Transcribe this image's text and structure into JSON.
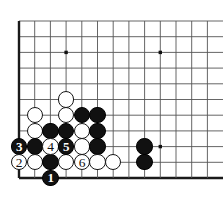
{
  "figure": {
    "kind": "go-board-diagram",
    "board": {
      "line_color": "#555555",
      "edge_color": "#1a1a1a",
      "background": "#ffffff",
      "origin_x": 19,
      "origin_y": 21,
      "spacing": 15.7,
      "cols": 13,
      "rows": 11,
      "edge_left_width": 2.4,
      "edge_bottom_width": 2.4,
      "line_width": 0.9
    },
    "star_points": [
      {
        "col": 3,
        "row": 2,
        "label": "hoshi-upper-left"
      },
      {
        "col": 9,
        "row": 2,
        "label": "hoshi-upper-right"
      },
      {
        "col": 9,
        "row": 8,
        "label": "hoshi-lower-right"
      }
    ],
    "stone_radius": 8.2,
    "stones": [
      {
        "col": 3,
        "row": 5,
        "color": "white",
        "label": ""
      },
      {
        "col": 1,
        "row": 6,
        "color": "white",
        "label": ""
      },
      {
        "col": 3,
        "row": 6,
        "color": "white",
        "label": ""
      },
      {
        "col": 4,
        "row": 6,
        "color": "black",
        "label": ""
      },
      {
        "col": 5,
        "row": 6,
        "color": "black",
        "label": ""
      },
      {
        "col": 1,
        "row": 7,
        "color": "white",
        "label": ""
      },
      {
        "col": 2,
        "row": 7,
        "color": "black",
        "label": ""
      },
      {
        "col": 3,
        "row": 7,
        "color": "black",
        "label": ""
      },
      {
        "col": 4,
        "row": 7,
        "color": "white",
        "label": ""
      },
      {
        "col": 5,
        "row": 7,
        "color": "black",
        "label": ""
      },
      {
        "col": 0,
        "row": 8,
        "color": "black",
        "label": "3"
      },
      {
        "col": 1,
        "row": 8,
        "color": "black",
        "label": ""
      },
      {
        "col": 2,
        "row": 8,
        "color": "white",
        "label": "4"
      },
      {
        "col": 3,
        "row": 8,
        "color": "black",
        "label": "5"
      },
      {
        "col": 4,
        "row": 8,
        "color": "white",
        "label": ""
      },
      {
        "col": 5,
        "row": 8,
        "color": "black",
        "label": ""
      },
      {
        "col": 8,
        "row": 8,
        "color": "black",
        "label": ""
      },
      {
        "col": 0,
        "row": 9,
        "color": "white",
        "label": "2"
      },
      {
        "col": 1,
        "row": 9,
        "color": "white",
        "label": ""
      },
      {
        "col": 2,
        "row": 9,
        "color": "black",
        "label": ""
      },
      {
        "col": 3,
        "row": 9,
        "color": "white",
        "label": ""
      },
      {
        "col": 4,
        "row": 9,
        "color": "white",
        "label": "6"
      },
      {
        "col": 5,
        "row": 9,
        "color": "white",
        "label": ""
      },
      {
        "col": 6,
        "row": 9,
        "color": "white",
        "label": ""
      },
      {
        "col": 8,
        "row": 9,
        "color": "black",
        "label": ""
      },
      {
        "col": 2,
        "row": 10,
        "color": "black",
        "label": "1"
      }
    ],
    "move_numbers": {
      "1": {
        "color": "black",
        "col": 2,
        "row": 10
      },
      "2": {
        "color": "white",
        "col": 0,
        "row": 9
      },
      "3": {
        "color": "black",
        "col": 0,
        "row": 8
      },
      "4": {
        "color": "white",
        "col": 2,
        "row": 8
      },
      "5": {
        "color": "black",
        "col": 3,
        "row": 8
      },
      "6": {
        "color": "white",
        "col": 4,
        "row": 9
      }
    }
  }
}
